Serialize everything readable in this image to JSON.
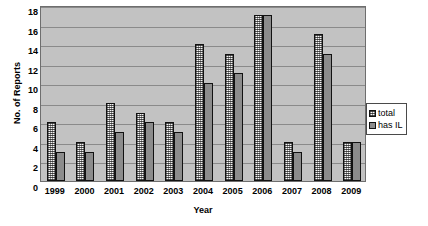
{
  "chart_data": {
    "type": "bar",
    "title": "",
    "xlabel": "Year",
    "ylabel": "No. of Reports",
    "categories": [
      "1999",
      "2000",
      "2001",
      "2002",
      "2003",
      "2004",
      "2005",
      "2006",
      "2007",
      "2008",
      "2009"
    ],
    "series": [
      {
        "name": "total",
        "values": [
          6,
          4,
          8,
          7,
          6,
          14,
          13,
          17,
          4,
          15,
          4
        ]
      },
      {
        "name": "has IL",
        "values": [
          3,
          3,
          5,
          6,
          5,
          10,
          11,
          17,
          3,
          13,
          4
        ]
      }
    ],
    "ylim": [
      0,
      18
    ],
    "ytick_step": 2,
    "yticks": [
      "18",
      "16",
      "14",
      "12",
      "10",
      "8",
      "6",
      "4",
      "2",
      "0"
    ],
    "grid": true,
    "legend_position": "right",
    "colors": {
      "total": "#d8d8d8",
      "has_IL": "#8c8c8c",
      "plot_background": "#c2c2c2",
      "gridline": "#8a8a8a",
      "axis_border": "#6e6e6e",
      "text": "#000000",
      "legend_background": "#ffffff"
    }
  },
  "legend": {
    "items": [
      {
        "label": "total"
      },
      {
        "label": "has IL"
      }
    ]
  }
}
